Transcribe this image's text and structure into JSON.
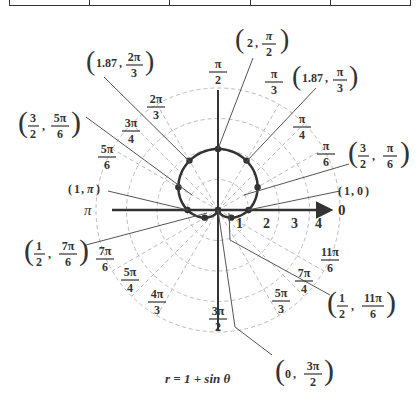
{
  "top_table": {
    "columns": 5
  },
  "graph": {
    "equation": "r = 1 + sin θ",
    "origin": [
      218,
      210
    ],
    "unit_px": 30.5,
    "radial_ticks": [
      "1",
      "2",
      "3",
      "4"
    ],
    "polar_axis_label": "0",
    "pi_label": "π"
  },
  "angle_labels": [
    {
      "num": "π",
      "den": "2",
      "deg": 90
    },
    {
      "num": "π",
      "den": "3",
      "deg": 60
    },
    {
      "num": "π",
      "den": "4",
      "deg": 45
    },
    {
      "num": "π",
      "den": "6",
      "deg": 30
    },
    {
      "num": "2π",
      "den": "3",
      "deg": 120
    },
    {
      "num": "3π",
      "den": "4",
      "deg": 135
    },
    {
      "num": "5π",
      "den": "6",
      "deg": 150
    },
    {
      "num": "7π",
      "den": "6",
      "deg": 210
    },
    {
      "num": "5π",
      "den": "4",
      "deg": 225
    },
    {
      "num": "4π",
      "den": "3",
      "deg": 240
    },
    {
      "num": "3π",
      "den": "2",
      "deg": 270
    },
    {
      "num": "5π",
      "den": "3",
      "deg": 300
    },
    {
      "num": "7π",
      "den": "4",
      "deg": 315
    },
    {
      "num": "11π",
      "den": "6",
      "deg": 330
    }
  ],
  "points": [
    {
      "label_r": "2",
      "label_num": "π",
      "label_den": "2",
      "r": 2,
      "deg": 90
    },
    {
      "label_r": "1.87",
      "label_num": "π",
      "label_den": "3",
      "r": 1.87,
      "deg": 60
    },
    {
      "label_r": "1.87",
      "label_num": "2π",
      "label_den": "3",
      "r": 1.87,
      "deg": 120
    },
    {
      "label_r_num": "3",
      "label_r_den": "2",
      "label_num": "π",
      "label_den": "6",
      "r": 1.5,
      "deg": 30
    },
    {
      "label_r_num": "3",
      "label_r_den": "2",
      "label_num": "5π",
      "label_den": "6",
      "r": 1.5,
      "deg": 150
    },
    {
      "label_r": "1",
      "label_num": "0",
      "r": 1,
      "deg": 0
    },
    {
      "label_r": "1",
      "label_num": "π",
      "r": 1,
      "deg": 180
    },
    {
      "label_r_num": "1",
      "label_r_den": "2",
      "label_num": "7π",
      "label_den": "6",
      "r": 0.5,
      "deg": 210
    },
    {
      "label_r_num": "1",
      "label_r_den": "2",
      "label_num": "11π",
      "label_den": "6",
      "r": 0.5,
      "deg": 330
    },
    {
      "label_r": "0",
      "label_num": "3π",
      "label_den": "2",
      "r": 0,
      "deg": 270
    }
  ],
  "chart_data": {
    "type": "scatter",
    "title": "r = 1 + sin θ",
    "coordinate_system": "polar",
    "radial_ticks": [
      1,
      2,
      3,
      4
    ],
    "angle_ticks": [
      "0",
      "π/6",
      "π/4",
      "π/3",
      "π/2",
      "2π/3",
      "3π/4",
      "5π/6",
      "π",
      "7π/6",
      "5π/4",
      "4π/3",
      "3π/2",
      "5π/3",
      "7π/4",
      "11π/6"
    ],
    "series": [
      {
        "name": "r = 1 + sin θ",
        "theta": [
          "0",
          "π/6",
          "π/3",
          "π/2",
          "2π/3",
          "5π/6",
          "π",
          "7π/6",
          "3π/2",
          "11π/6"
        ],
        "r": [
          1,
          1.5,
          1.87,
          2,
          1.87,
          1.5,
          1,
          0.5,
          0,
          0.5
        ]
      }
    ]
  }
}
